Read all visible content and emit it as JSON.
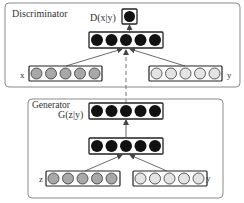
{
  "diagram": {
    "colors": {
      "frame": "#8a8a8a",
      "layer_border": "#222222",
      "hidden_node": "#111111",
      "x_input_node": "#a8a8a8",
      "z_input_node": "#a8a8a8",
      "y_input_node": "#e4e4e4",
      "arrow": "#444444",
      "dashed": "#666666"
    },
    "discriminator": {
      "label": "Discriminator",
      "output_label": "D(x|y)",
      "output_nodes": 1,
      "hidden_nodes": 5,
      "x_label": "x",
      "x_nodes": 5,
      "y_label": "y",
      "y_nodes": 5
    },
    "generator": {
      "label": "Generator",
      "output_label": "G(z|y)",
      "output_nodes": 5,
      "hidden_nodes": 5,
      "z_label": "z",
      "z_nodes": 5,
      "y_label": "y",
      "y_nodes": 5
    },
    "connections": [
      {
        "from": "discriminator.x",
        "to": "discriminator.hidden",
        "style": "arrow"
      },
      {
        "from": "discriminator.y",
        "to": "discriminator.hidden",
        "style": "arrow"
      },
      {
        "from": "discriminator.hidden",
        "to": "discriminator.output",
        "style": "arrow"
      },
      {
        "from": "generator.z",
        "to": "generator.hidden",
        "style": "arrow"
      },
      {
        "from": "generator.y",
        "to": "generator.hidden",
        "style": "arrow"
      },
      {
        "from": "generator.hidden",
        "to": "generator.output",
        "style": "arrow"
      },
      {
        "from": "generator.output",
        "to": "discriminator.hidden",
        "style": "dashed-arrow"
      }
    ]
  }
}
